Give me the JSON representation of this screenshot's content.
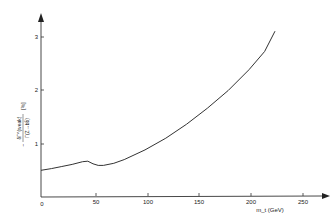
{
  "chart_data": {
    "type": "line",
    "title": "",
    "xlabel": "m_t (GeV)",
    "ylabel": "- δΓ^(weak) / Γ(Z→bb̄) (%)",
    "xlim": [
      0,
      260
    ],
    "ylim": [
      0,
      3.4
    ],
    "grid": false,
    "x_ticks": [
      "0",
      "50",
      "100",
      "150",
      "200",
      "250"
    ],
    "y_ticks": [
      "1",
      "2",
      "3"
    ],
    "series": [
      {
        "name": "weak correction",
        "x": [
          0,
          10,
          20,
          30,
          40,
          45,
          50,
          55,
          60,
          70,
          80,
          100,
          120,
          140,
          160,
          180,
          200,
          215,
          225
        ],
        "y": [
          0.5,
          0.53,
          0.57,
          0.61,
          0.66,
          0.67,
          0.62,
          0.59,
          0.59,
          0.63,
          0.7,
          0.88,
          1.1,
          1.36,
          1.66,
          1.99,
          2.38,
          2.72,
          3.1
        ]
      }
    ]
  },
  "labels": {
    "x_axis": "m_t (GeV)",
    "y_axis_num": "δΓ^(weak)",
    "y_axis_den": "Γ(Z→bb̄)",
    "y_axis_unit": "[%]",
    "x_ticks": [
      "0",
      "50",
      "100",
      "150",
      "200",
      "250"
    ],
    "y_ticks": [
      "1",
      "2",
      "3"
    ]
  }
}
